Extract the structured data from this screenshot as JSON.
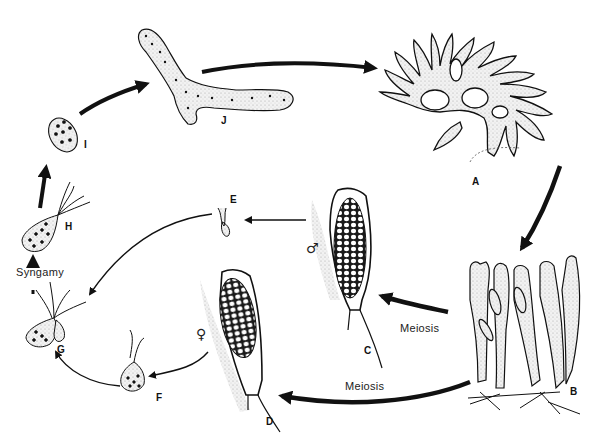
{
  "diagram": {
    "type": "life-cycle",
    "stages": [
      {
        "id": "A",
        "label": "A",
        "description": "mature branched thallus (diploid sporophyte)"
      },
      {
        "id": "B",
        "label": "B",
        "description": "clustered cylindrical sporangial filaments"
      },
      {
        "id": "C",
        "label": "C",
        "description": "male gametangium"
      },
      {
        "id": "D",
        "label": "D",
        "description": "female gametangium"
      },
      {
        "id": "E",
        "label": "E",
        "description": "male gamete (biflagellate)"
      },
      {
        "id": "F",
        "label": "F",
        "description": "female gamete (biflagellate)"
      },
      {
        "id": "G",
        "label": "G",
        "description": "gametes fusing"
      },
      {
        "id": "H",
        "label": "H",
        "description": "quadriflagellate zygote"
      },
      {
        "id": "I",
        "label": "I",
        "description": "settled zygote"
      },
      {
        "id": "J",
        "label": "J",
        "description": "germinating young thallus"
      }
    ],
    "annotations": {
      "meiosis_upper": "Meiosis",
      "meiosis_lower": "Meiosis",
      "syngamy": "Syngamy",
      "male_symbol": "♂",
      "female_symbol": "♀"
    },
    "edges": [
      {
        "from": "A",
        "to": "B"
      },
      {
        "from": "B",
        "to": "C",
        "label": "Meiosis"
      },
      {
        "from": "B",
        "to": "D",
        "label": "Meiosis"
      },
      {
        "from": "C",
        "to": "E"
      },
      {
        "from": "D",
        "to": "F"
      },
      {
        "from": "E",
        "to": "G"
      },
      {
        "from": "F",
        "to": "G"
      },
      {
        "from": "G",
        "to": "H",
        "label": "Syngamy"
      },
      {
        "from": "H",
        "to": "I"
      },
      {
        "from": "I",
        "to": "J"
      },
      {
        "from": "J",
        "to": "A"
      }
    ],
    "colors": {
      "ink": "#111111",
      "stipple": "#e6e6e6",
      "background": "#ffffff"
    }
  }
}
